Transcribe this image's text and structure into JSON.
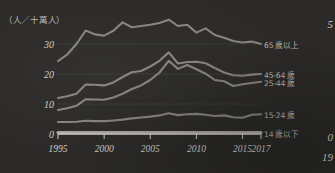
{
  "chart_data": {
    "type": "line",
    "title": "",
    "ylabel": "（人／十萬人）",
    "xlabel": "",
    "x": [
      1995,
      1996,
      1997,
      1998,
      1999,
      2000,
      2001,
      2002,
      2003,
      2004,
      2005,
      2006,
      2007,
      2008,
      2009,
      2010,
      2011,
      2012,
      2013,
      2014,
      2015,
      2016,
      2017
    ],
    "xlim": [
      1995,
      2017
    ],
    "ylim": [
      0,
      40
    ],
    "yticks": [
      0,
      10,
      20,
      30
    ],
    "xticks": [
      1995,
      2000,
      2005,
      2010,
      2015,
      2017
    ],
    "grid": true,
    "legend_position": "right",
    "series": [
      {
        "name": "65 歲以上",
        "color": "#9a978e",
        "values": [
          24.3,
          26.5,
          30.0,
          34.5,
          33.2,
          32.8,
          34.4,
          37.2,
          35.6,
          36.0,
          36.4,
          37.0,
          38.1,
          36.0,
          36.4,
          33.8,
          35.2,
          33.0,
          32.1,
          31.0,
          30.5,
          30.8,
          30.0
        ]
      },
      {
        "name": "45-64 歲",
        "color": "#9a978e",
        "values": [
          12.0,
          12.6,
          13.4,
          16.5,
          16.4,
          16.2,
          17.2,
          19.0,
          20.6,
          21.0,
          22.5,
          24.4,
          27.2,
          23.5,
          24.0,
          24.1,
          23.6,
          22.0,
          20.5,
          19.6,
          19.4,
          19.8,
          20.0
        ]
      },
      {
        "name": "25-44 歲",
        "color": "#9a978e",
        "values": [
          8.0,
          8.6,
          9.4,
          11.6,
          11.5,
          11.4,
          12.2,
          13.4,
          15.0,
          16.2,
          18.0,
          20.5,
          24.4,
          21.7,
          23.0,
          21.6,
          20.1,
          18.0,
          17.6,
          16.0,
          16.6,
          17.0,
          17.4
        ]
      },
      {
        "name": "15-24 歲",
        "color": "#9a978e",
        "values": [
          4.0,
          4.0,
          4.1,
          4.4,
          4.3,
          4.3,
          4.5,
          4.8,
          5.2,
          5.5,
          5.8,
          6.2,
          6.9,
          6.3,
          6.6,
          6.7,
          6.4,
          6.0,
          6.2,
          5.6,
          5.4,
          6.4,
          6.6
        ]
      },
      {
        "name": "14 歲以下",
        "color": "#aeaba3",
        "values": [
          0.5,
          0.5,
          0.5,
          0.5,
          0.5,
          0.5,
          0.5,
          0.5,
          0.5,
          0.5,
          0.5,
          0.5,
          0.5,
          0.5,
          0.5,
          0.5,
          0.5,
          0.5,
          0.5,
          0.5,
          0.5,
          0.5,
          0.5
        ]
      }
    ]
  },
  "neighbor_chart": {
    "top_value": "5",
    "zero_value": "0",
    "year_partial": "19"
  },
  "top_caption": ""
}
